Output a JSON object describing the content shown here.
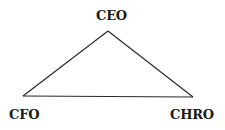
{
  "diagram": {
    "type": "triangle",
    "nodes": [
      {
        "id": "ceo",
        "label": "CEO",
        "position": "top"
      },
      {
        "id": "cfo",
        "label": "CFO",
        "position": "bottom-left"
      },
      {
        "id": "chro",
        "label": "CHRO",
        "position": "bottom-right"
      }
    ],
    "edges": [
      {
        "from": "ceo",
        "to": "cfo"
      },
      {
        "from": "ceo",
        "to": "chro"
      },
      {
        "from": "cfo",
        "to": "chro"
      }
    ],
    "line_color": "#2a2a2a",
    "text_color": "#1a1a1a"
  }
}
